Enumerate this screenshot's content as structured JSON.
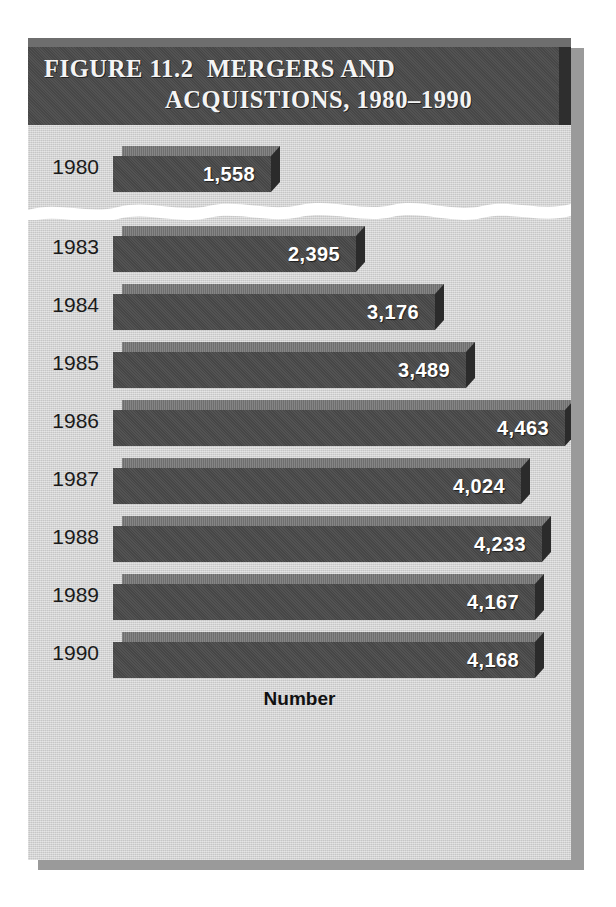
{
  "figure": {
    "title_line1": "FIGURE 11.2  MERGERS AND",
    "title_line2": "ACQUISTIONS, 1980–1990",
    "xlabel": "Number",
    "break_note": "axis-break"
  },
  "colors": {
    "panel_bg": "#d2d2d2",
    "title_bar": "#4b4b4b",
    "bar_front": "#4a4a4a",
    "bar_top": "#747474",
    "bar_cap": "#2b2b2b",
    "value_text": "#ffffff",
    "label_text": "#1a1a1a",
    "break_band": "#ffffff"
  },
  "chart_data": {
    "type": "bar",
    "orientation": "horizontal",
    "title": "FIGURE 11.2  MERGERS AND ACQUISTIONS, 1980–1990",
    "xlabel": "Number",
    "ylabel": "",
    "categories": [
      "1980",
      "1983",
      "1984",
      "1985",
      "1986",
      "1987",
      "1988",
      "1989",
      "1990"
    ],
    "values": [
      1558,
      2395,
      3176,
      3489,
      4463,
      4024,
      4233,
      4167,
      4168
    ],
    "value_labels": [
      "1,558",
      "2,395",
      "3,176",
      "3,489",
      "4,463",
      "4,024",
      "4,233",
      "4,167",
      "4,168"
    ],
    "xlim": [
      0,
      4463
    ],
    "grid": false,
    "legend": null,
    "axis_break": {
      "after_category": "1980",
      "omitted_categories": [
        "1981",
        "1982"
      ],
      "style": "wavy-white-band"
    },
    "bars": [
      {
        "year": "1980",
        "value": 1558,
        "label": "1,558"
      },
      {
        "year": "1983",
        "value": 2395,
        "label": "2,395"
      },
      {
        "year": "1984",
        "value": 3176,
        "label": "3,176"
      },
      {
        "year": "1985",
        "value": 3489,
        "label": "3,489"
      },
      {
        "year": "1986",
        "value": 4463,
        "label": "4,463"
      },
      {
        "year": "1987",
        "value": 4024,
        "label": "4,024"
      },
      {
        "year": "1988",
        "value": 4233,
        "label": "4,233"
      },
      {
        "year": "1989",
        "value": 4167,
        "label": "4,167"
      },
      {
        "year": "1990",
        "value": 4168,
        "label": "4,168"
      }
    ]
  }
}
